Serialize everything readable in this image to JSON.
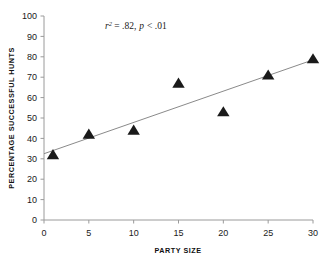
{
  "chart_data": {
    "type": "scatter",
    "title": "",
    "xlabel": "PARTY SIZE",
    "ylabel": "PERCENTAGE SUCCESSFUL HUNTS",
    "xlim": [
      0,
      30
    ],
    "ylim": [
      0,
      100
    ],
    "xticks": [
      0,
      5,
      10,
      15,
      20,
      25,
      30
    ],
    "yticks": [
      0,
      10,
      20,
      30,
      40,
      50,
      60,
      70,
      80,
      90,
      100
    ],
    "grid": false,
    "legend": null,
    "marker": "triangle-up",
    "marker_color": "#1a1a1a",
    "points": [
      {
        "x": 1,
        "y": 32
      },
      {
        "x": 5,
        "y": 42
      },
      {
        "x": 10,
        "y": 44
      },
      {
        "x": 15,
        "y": 67
      },
      {
        "x": 20,
        "y": 53
      },
      {
        "x": 25,
        "y": 71
      },
      {
        "x": 30,
        "y": 79
      }
    ],
    "trendline": {
      "type": "linear",
      "color": "#8a8a8a",
      "x_start": 0,
      "y_start": 32.5,
      "x_end": 30,
      "y_end": 78.5
    },
    "annotations": [
      {
        "id": "stats",
        "r_symbol": "r",
        "r_exponent": "2",
        "r_value": "= .82,",
        "p_symbol": "p",
        "p_value": "< .01",
        "full_text": "r2 = .82, p < .01",
        "x": 6.8,
        "y": 92
      }
    ]
  },
  "axes": {
    "x_tick_labels": [
      "0",
      "5",
      "10",
      "15",
      "20",
      "25",
      "30"
    ],
    "y_tick_labels": [
      "0",
      "10",
      "20",
      "30",
      "40",
      "50",
      "60",
      "70",
      "80",
      "90",
      "100"
    ],
    "x_axis_title": "PARTY SIZE",
    "y_axis_title": "PERCENTAGE SUCCESSFUL HUNTS"
  },
  "colors": {
    "axis": "#9a9a9a",
    "marker": "#1a1a1a",
    "trendline": "#8a8a8a",
    "text": "#1a1a1a",
    "background": "#ffffff"
  }
}
